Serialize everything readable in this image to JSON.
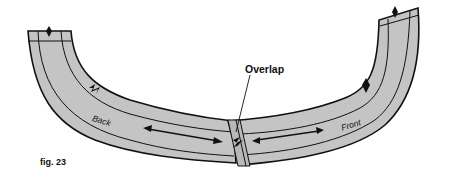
{
  "figure": {
    "caption": "fig. 23",
    "labels": {
      "overlap": "Overlap",
      "back": "Back",
      "front": "Front"
    },
    "pieces": [
      {
        "name": "Back",
        "side": "left",
        "notch": "double",
        "grainline": "double-arrow"
      },
      {
        "name": "Front",
        "side": "right",
        "notch": "single",
        "grainline": "double-arrow"
      }
    ],
    "colors": {
      "fill": "#c4c4c4",
      "stroke": "#111111",
      "background": "#ffffff"
    }
  }
}
